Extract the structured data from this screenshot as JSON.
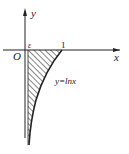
{
  "figure": {
    "axes": {
      "x_label": "x",
      "y_label": "y",
      "origin_label": "O"
    },
    "ticks": {
      "epsilon_label": "ε",
      "one_label": "1"
    },
    "curve": {
      "label": "y=lnx",
      "function": "ln x"
    },
    "shaded_region": {
      "description": "region between y=ln x and x-axis for ε ≤ x ≤ 1",
      "fill": "hatched"
    },
    "colors": {
      "stroke": "#222222",
      "background": "#ffffff"
    }
  }
}
